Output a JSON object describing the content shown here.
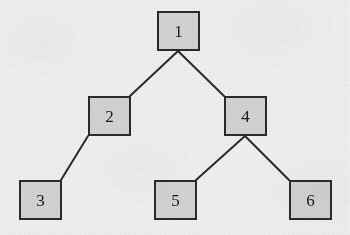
{
  "diagram": {
    "type": "tree",
    "title": "",
    "canvas": {
      "width": 350,
      "height": 235
    },
    "colors": {
      "background": "#f2f2f0",
      "node_fill": "#d5d5d5",
      "node_border": "#2b2b2b",
      "edge": "#2b2b2b",
      "label": "#1a1a1a"
    },
    "node_size": {
      "width": 43,
      "height": 40
    },
    "nodes": [
      {
        "id": "1",
        "label": "1",
        "x": 157,
        "y": 11,
        "depth": 0
      },
      {
        "id": "2",
        "label": "2",
        "x": 88,
        "y": 96,
        "depth": 1
      },
      {
        "id": "4",
        "label": "4",
        "x": 224,
        "y": 96,
        "depth": 1
      },
      {
        "id": "3",
        "label": "3",
        "x": 19,
        "y": 180,
        "depth": 2
      },
      {
        "id": "5",
        "label": "5",
        "x": 154,
        "y": 180,
        "depth": 2
      },
      {
        "id": "6",
        "label": "6",
        "x": 289,
        "y": 180,
        "depth": 2
      }
    ],
    "edges": [
      {
        "from": "1",
        "to": "2",
        "x1": 178,
        "y1": 51,
        "x2": 130,
        "y2": 96
      },
      {
        "from": "1",
        "to": "4",
        "x1": 178,
        "y1": 51,
        "x2": 224,
        "y2": 96
      },
      {
        "from": "2",
        "to": "3",
        "x1": 88,
        "y1": 136,
        "x2": 61,
        "y2": 180
      },
      {
        "from": "4",
        "to": "5",
        "x1": 245,
        "y1": 136,
        "x2": 196,
        "y2": 180
      },
      {
        "from": "4",
        "to": "6",
        "x1": 245,
        "y1": 136,
        "x2": 289,
        "y2": 180
      }
    ]
  }
}
